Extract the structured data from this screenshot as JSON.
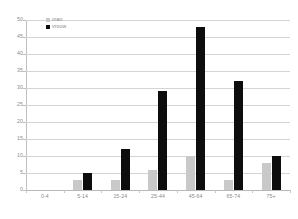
{
  "chart_data": {
    "type": "bar",
    "title": "",
    "xlabel": "",
    "ylabel": "",
    "categories": [
      "0-4",
      "5-14",
      "15-24",
      "25-44",
      "45-64",
      "65-74",
      "75+"
    ],
    "series": [
      {
        "name": "man",
        "color": "#c9c9c9",
        "values": [
          0,
          3,
          3,
          6,
          10,
          3,
          8
        ]
      },
      {
        "name": "vrouw",
        "color": "#0d0d0d",
        "values": [
          0,
          5,
          12,
          29,
          48,
          32,
          10
        ]
      }
    ],
    "ylim": [
      0,
      50
    ],
    "yticks": [
      0,
      5,
      10,
      15,
      20,
      25,
      30,
      35,
      40,
      45,
      50
    ],
    "ytick_labels": [
      "0",
      "5",
      "10",
      "15",
      "20",
      "25",
      "30",
      "35",
      "40",
      "45",
      "50"
    ],
    "grid": true,
    "legend_position": "top-left",
    "legend": [
      "man",
      "vrouw"
    ]
  }
}
